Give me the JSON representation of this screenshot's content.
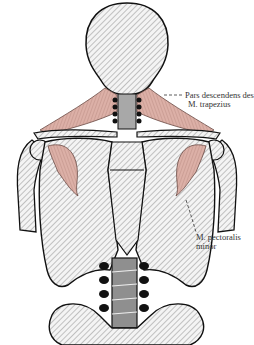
{
  "figure": {
    "colors": {
      "muscle": "#d9aea4",
      "muscle_stroke": "#8a5a52",
      "bone_fill": "#e6e6e6",
      "outline": "#111111",
      "hatch": "#777777",
      "spine": "#9a9a9a"
    },
    "labels": {
      "trapezius_line1": "Pars descendens des",
      "trapezius_line2": "M. trapezius",
      "pectoralis_line1": "M. pectoralis",
      "pectoralis_line2": "minor"
    }
  }
}
